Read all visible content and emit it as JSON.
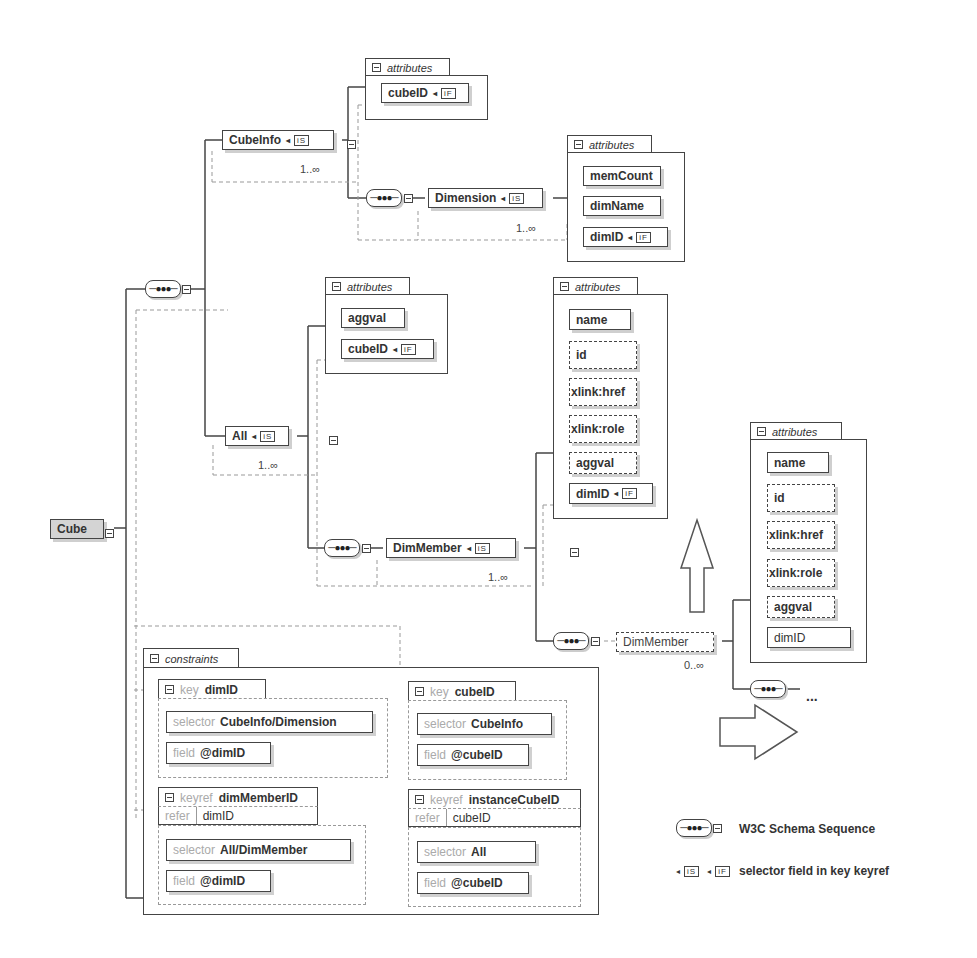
{
  "diagram": {
    "type": "xml-schema-diagram",
    "root": {
      "label": "Cube"
    },
    "cube_info": {
      "label": "CubeInfo",
      "badge": "iS",
      "multiplicity": "1..∞",
      "attributes": {
        "title": "attributes",
        "items": [
          {
            "label": "cubeID",
            "badge": "iF"
          }
        ]
      }
    },
    "dimension": {
      "label": "Dimension",
      "badge": "iS",
      "multiplicity": "1..∞",
      "attributes": {
        "title": "attributes",
        "items": [
          {
            "label": "memCount"
          },
          {
            "label": "dimName"
          },
          {
            "label": "dimID",
            "badge": "iF"
          }
        ]
      }
    },
    "all": {
      "label": "All",
      "badge": "iS",
      "multiplicity": "1..∞",
      "attributes": {
        "title": "attributes",
        "items": [
          {
            "label": "aggval"
          },
          {
            "label": "cubeID",
            "badge": "iF"
          }
        ]
      }
    },
    "dim_member": {
      "label": "DimMember",
      "badge": "iS",
      "multiplicity": "1..∞",
      "attributes": {
        "title": "attributes",
        "items": [
          {
            "label": "name",
            "optional": false
          },
          {
            "label": "id",
            "optional": true
          },
          {
            "label": "xlink:href",
            "optional": true
          },
          {
            "label": "xlink:role",
            "optional": true
          },
          {
            "label": "aggval",
            "optional": true
          },
          {
            "label": "dimID",
            "badge": "iF",
            "optional": false
          }
        ]
      }
    },
    "dim_member_recursive": {
      "label": "DimMember",
      "multiplicity": "0..∞",
      "ellipsis": "...",
      "attributes": {
        "title": "attributes",
        "items": [
          {
            "label": "name",
            "optional": false
          },
          {
            "label": "id",
            "optional": true
          },
          {
            "label": "xlink:href",
            "optional": true
          },
          {
            "label": "xlink:role",
            "optional": true
          },
          {
            "label": "aggval",
            "optional": true
          },
          {
            "label": "dimID",
            "optional": false
          }
        ]
      }
    },
    "constraints": {
      "title": "constraints",
      "keys": [
        {
          "kind": "key",
          "name": "dimID",
          "selector_label": "selector",
          "selector": "CubeInfo/Dimension",
          "field_label": "field",
          "field": "@dimID"
        },
        {
          "kind": "key",
          "name": "cubeID",
          "selector_label": "selector",
          "selector": "CubeInfo",
          "field_label": "field",
          "field": "@cubeID"
        }
      ],
      "keyrefs": [
        {
          "kind": "keyref",
          "name": "dimMemberID",
          "refer_label": "refer",
          "refer": "dimID",
          "selector_label": "selector",
          "selector": "All/DimMember",
          "field_label": "field",
          "field": "@dimID"
        },
        {
          "kind": "keyref",
          "name": "instanceCubeID",
          "refer_label": "refer",
          "refer": "cubeID",
          "selector_label": "selector",
          "selector": "All",
          "field_label": "field",
          "field": "@cubeID"
        }
      ]
    },
    "legend": {
      "sequence": "W3C Schema Sequence",
      "selector_field": "selector field in key keyref",
      "badge_s": "iS",
      "badge_f": "iF"
    },
    "arrows": [
      "up",
      "right"
    ]
  }
}
